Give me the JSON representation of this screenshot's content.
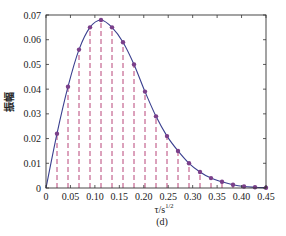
{
  "chart_data": {
    "type": "line",
    "title": "",
    "caption": "(d)",
    "xlabel": "τ/s^1/2",
    "xlabel_base": "τ/s",
    "xlabel_sup": "1/2",
    "ylabel": "振幅",
    "xlim": [
      0,
      0.45
    ],
    "ylim": [
      0,
      0.07
    ],
    "xticks": [
      0,
      0.05,
      0.1,
      0.15,
      0.2,
      0.25,
      0.3,
      0.35,
      0.4,
      0.45
    ],
    "xtick_labels": [
      "0",
      "0.05",
      "0.10",
      "0.15",
      "0.20",
      "0.25",
      "0.30",
      "0.35",
      "0.40",
      "0.45"
    ],
    "yticks": [
      0,
      0.01,
      0.02,
      0.03,
      0.04,
      0.05,
      0.06,
      0.07
    ],
    "ytick_labels": [
      "0",
      "0.01",
      "0.02",
      "0.03",
      "0.04",
      "0.05",
      "0.06",
      "0.07"
    ],
    "grid": false,
    "legend": null,
    "series": [
      {
        "name": "curve",
        "style": "solid line",
        "color": "#3a3f8f",
        "x": [
          0,
          0.0225,
          0.045,
          0.0675,
          0.09,
          0.1125,
          0.135,
          0.1575,
          0.18,
          0.2025,
          0.225,
          0.2475,
          0.27,
          0.2925,
          0.315,
          0.3375,
          0.36,
          0.3825,
          0.405,
          0.4275,
          0.45
        ],
        "y": [
          0,
          0.022,
          0.041,
          0.056,
          0.065,
          0.068,
          0.065,
          0.059,
          0.05,
          0.039,
          0.029,
          0.021,
          0.015,
          0.01,
          0.0065,
          0.004,
          0.0025,
          0.0013,
          0.0006,
          0.0003,
          0.0001
        ]
      },
      {
        "name": "samples",
        "style": "markers with dashed stems",
        "marker_color": "#7a3f8a",
        "stem_color": "#b0306a",
        "x": [
          0.0225,
          0.045,
          0.0675,
          0.09,
          0.1125,
          0.135,
          0.1575,
          0.18,
          0.2025,
          0.225,
          0.2475,
          0.27,
          0.2925,
          0.315,
          0.3375,
          0.36,
          0.3825,
          0.405,
          0.4275,
          0.45
        ],
        "y": [
          0.022,
          0.041,
          0.056,
          0.065,
          0.068,
          0.065,
          0.059,
          0.05,
          0.039,
          0.029,
          0.021,
          0.015,
          0.01,
          0.0065,
          0.004,
          0.0025,
          0.0013,
          0.0006,
          0.0003,
          0.0001
        ]
      }
    ]
  }
}
